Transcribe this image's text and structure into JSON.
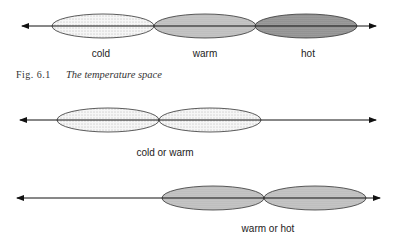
{
  "figure": {
    "number": "Fig. 6.1",
    "caption": "The temperature space"
  },
  "diagrams": [
    {
      "id": "temperature-space",
      "regions": [
        {
          "label": "cold",
          "pattern": "light-dots"
        },
        {
          "label": "warm",
          "pattern": "medium-gray"
        },
        {
          "label": "hot",
          "pattern": "dark-gray"
        }
      ]
    },
    {
      "id": "cold-or-warm",
      "label": "cold or warm",
      "regions": [
        {
          "pattern": "light-dots"
        },
        {
          "pattern": "light-dots"
        }
      ]
    },
    {
      "id": "warm-or-hot",
      "label": "warm or hot",
      "regions": [
        {
          "pattern": "medium-gray"
        },
        {
          "pattern": "medium-gray"
        }
      ]
    }
  ],
  "colors": {
    "line": "#333333",
    "light_fill": "#f4f4f4",
    "medium_fill": "#c8c8c8",
    "dark_fill": "#a0a0a0"
  }
}
